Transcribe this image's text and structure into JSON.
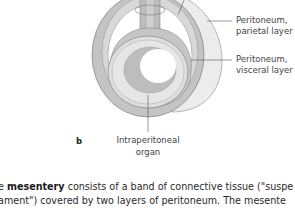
{
  "figure": {
    "panel_letter": "b",
    "labels": {
      "parietal": [
        "Peritoneum,",
        "parietal layer"
      ],
      "visceral": [
        "Peritoneum,",
        "visceral layer"
      ],
      "organ": [
        "Intraperitoneal",
        "organ"
      ]
    },
    "colors": {
      "outer_ring": "#e6e6e6",
      "inner_tissue": "#b9b9b9",
      "organ_wall": "#d9d9d9",
      "lumen": "#ffffff",
      "stroke": "#888888"
    }
  },
  "text": {
    "line1_prefix": "e ",
    "line1_bold": "mesentery",
    "line1_rest": " consists of a band of connective tissue (\"suspe",
    "line2": "ament\") covered by two layers of peritoneum. The mesente"
  }
}
